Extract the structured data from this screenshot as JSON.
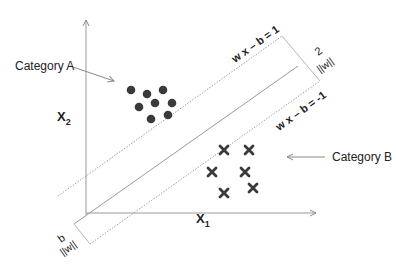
{
  "diagram": {
    "axes": {
      "x_label": "X",
      "x_sub": "1",
      "y_label": "X",
      "y_sub": "2"
    },
    "categories": {
      "a_label": "Category A",
      "b_label": "Category B"
    },
    "margins": {
      "upper_eq": "w x – b = 1",
      "lower_eq": "w x – b = -1",
      "width_num": "2",
      "width_den": "||w||",
      "offset_num": "b",
      "offset_den": "||w||"
    },
    "colors": {
      "points": "#3a3a3a",
      "lines": "#9a9a9a",
      "text": "#222222"
    },
    "points_a": [
      {
        "x": 131,
        "y": 90
      },
      {
        "x": 147,
        "y": 94
      },
      {
        "x": 163,
        "y": 90
      },
      {
        "x": 139,
        "y": 107
      },
      {
        "x": 155,
        "y": 103
      },
      {
        "x": 172,
        "y": 103
      },
      {
        "x": 151,
        "y": 119
      },
      {
        "x": 168,
        "y": 115
      }
    ],
    "points_b": [
      {
        "x": 224,
        "y": 150
      },
      {
        "x": 249,
        "y": 150
      },
      {
        "x": 212,
        "y": 172
      },
      {
        "x": 245,
        "y": 172
      },
      {
        "x": 224,
        "y": 193
      },
      {
        "x": 253,
        "y": 188
      }
    ]
  }
}
